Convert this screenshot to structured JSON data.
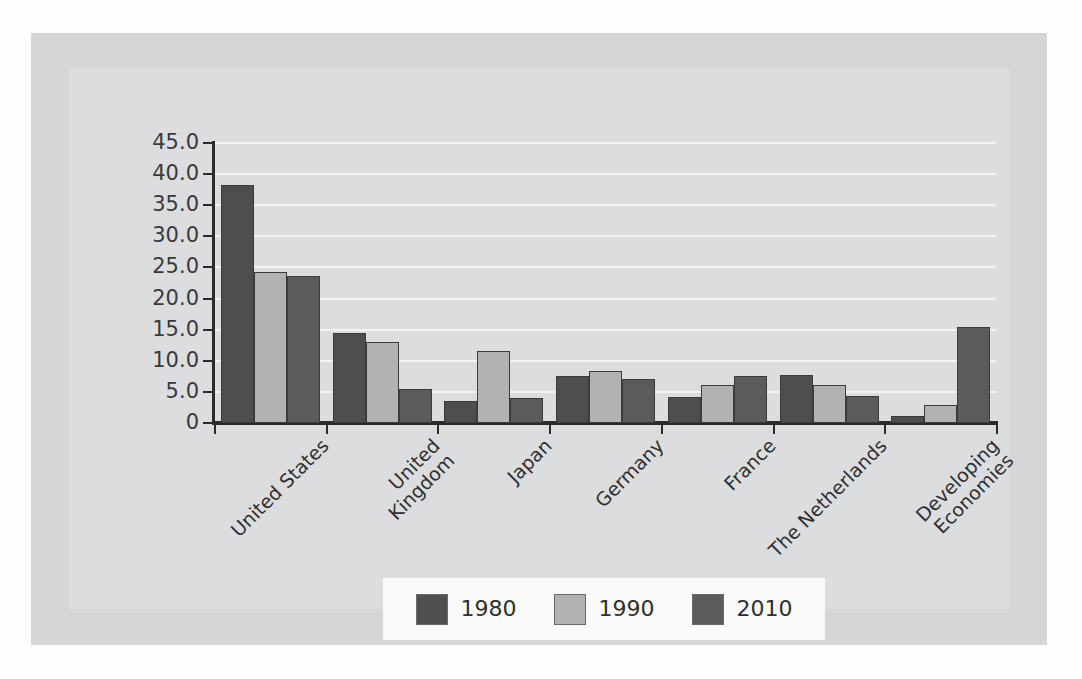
{
  "chart_data": {
    "type": "bar",
    "title": "",
    "subtitle": "",
    "xlabel": "",
    "ylabel": "",
    "ylim": [
      0,
      45
    ],
    "grid": true,
    "legend_position": "bottom",
    "categories": [
      "United States",
      "United Kingdom",
      "Japan",
      "Germany",
      "France",
      "The Netherlands",
      "Developing Economies"
    ],
    "category_labels_multiline": [
      "United States",
      "United\nKingdom",
      "Japan",
      "Germany",
      "France",
      "The Netherlands",
      "Developing\nEconomies"
    ],
    "series": [
      {
        "name": "1980",
        "color": "#4e4e4e",
        "values": [
          38.3,
          14.5,
          3.5,
          7.6,
          4.2,
          7.7,
          1.2
        ]
      },
      {
        "name": "1990",
        "color": "#b2b2b2",
        "values": [
          24.2,
          13.0,
          11.5,
          8.4,
          6.1,
          6.1,
          2.9
        ]
      },
      {
        "name": "2010",
        "color": "#5b5b5b",
        "values": [
          23.7,
          5.4,
          4.1,
          7.1,
          7.6,
          4.4,
          15.5
        ]
      }
    ],
    "y_ticks": [
      45.0,
      40.0,
      35.0,
      30.0,
      25.0,
      20.0,
      15.0,
      10.0,
      5.0,
      0
    ],
    "y_tick_labels": [
      "45.0",
      "40.0",
      "35.0",
      "30.0",
      "25.0",
      "20.0",
      "15.0",
      "10.0",
      "5.0",
      "0"
    ]
  },
  "legend": {
    "items": [
      {
        "label": "1980",
        "color": "#4e4e4e"
      },
      {
        "label": "1990",
        "color": "#b2b2b2"
      },
      {
        "label": "2010",
        "color": "#5b5b5b"
      }
    ]
  },
  "colors": {
    "page_background": "#fdfdfd",
    "frame_background": "#d5d6d8",
    "panel_background": "#dcdddf",
    "gridline": "#f2f3f4",
    "axis": "#2b2b2b",
    "text": "#2f2f2f",
    "legend_background": "#fafafa"
  }
}
